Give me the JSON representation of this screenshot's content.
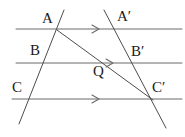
{
  "figure": {
    "background_color": "#ffffff",
    "line_color": "#6b6b6b",
    "transversal_color": "#4d4d4d",
    "label_color": "#1a1a1a",
    "width": 185,
    "height": 137
  },
  "parallel_lines": [
    {
      "name": "line-AA-prime",
      "label": "top parallel line",
      "x1": 16,
      "y1": 29,
      "x2": 182,
      "y2": 29,
      "arrow_x": 98,
      "arrow_y": 29
    },
    {
      "name": "line-BB-prime",
      "label": "middle parallel line",
      "x1": 16,
      "y1": 63,
      "x2": 182,
      "y2": 63,
      "arrow_x": 112,
      "arrow_y": 63
    },
    {
      "name": "line-CC-prime",
      "label": "bottom parallel line",
      "x1": 12,
      "y1": 99,
      "x2": 182,
      "y2": 99,
      "arrow_x": 98,
      "arrow_y": 99
    }
  ],
  "transversals": [
    {
      "name": "left-transversal-ABC",
      "x1": 64,
      "y1": 10,
      "x2": 19,
      "y2": 124
    },
    {
      "name": "right-transversal-ABC-prime",
      "x1": 104,
      "y1": 10,
      "x2": 166,
      "y2": 128
    }
  ],
  "diagonal": {
    "name": "diagonal-A-to-C-prime",
    "x1": 57,
    "y1": 30,
    "x2": 153,
    "y2": 100
  },
  "points": [
    {
      "id": "A",
      "label": "A",
      "x": 57,
      "y": 30,
      "label_x": 42,
      "label_y": 11
    },
    {
      "id": "B",
      "label": "B",
      "x": 44,
      "y": 63,
      "label_x": 30,
      "label_y": 43
    },
    {
      "id": "C",
      "label": "C",
      "x": 30,
      "y": 99,
      "label_x": 12,
      "label_y": 80
    },
    {
      "id": "Ap",
      "label": "A′",
      "x": 114,
      "y": 29,
      "label_x": 117,
      "label_y": 9
    },
    {
      "id": "Bp",
      "label": "B′",
      "x": 133,
      "y": 63,
      "label_x": 131,
      "label_y": 44
    },
    {
      "id": "Cp",
      "label": "C′",
      "x": 152,
      "y": 99,
      "label_x": 152,
      "label_y": 80
    },
    {
      "id": "Q",
      "label": "Q",
      "x": 100,
      "y": 62,
      "label_x": 93,
      "label_y": 64
    }
  ],
  "arrow_marker": {
    "name": "parallel-arrow-marker",
    "description": "single chevron arrowhead pointing right indicating parallel lines"
  }
}
